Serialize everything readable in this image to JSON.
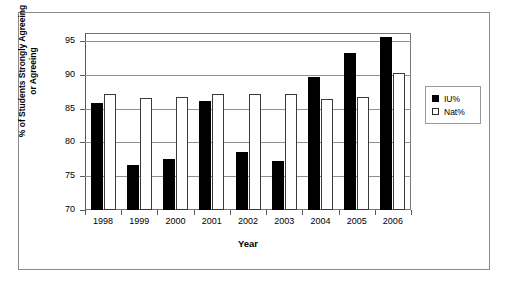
{
  "chart_data": {
    "type": "bar",
    "title": "",
    "xlabel": "Year",
    "ylabel": "% of Students Strongly Agreeing\nor Agreeing",
    "categories": [
      "1998",
      "1999",
      "2000",
      "2001",
      "2002",
      "2003",
      "2004",
      "2005",
      "2006"
    ],
    "series": [
      {
        "name": "IU%",
        "color": "#000000",
        "values": [
          85.9,
          76.6,
          77.5,
          86.1,
          78.6,
          77.2,
          89.7,
          93.3,
          95.6
        ]
      },
      {
        "name": "Nat%",
        "color": "#ffffff",
        "values": [
          87.2,
          86.6,
          86.8,
          87.2,
          87.2,
          87.2,
          86.5,
          86.8,
          90.3
        ]
      }
    ],
    "ylim": [
      70,
      96.2
    ],
    "yticks": [
      70,
      75,
      80,
      85,
      90,
      95
    ],
    "ytick_labels": [
      "70",
      "75",
      "80",
      "85",
      "90",
      "95"
    ],
    "grid": true,
    "grid_axis": "y",
    "legend_position": "right-outside"
  },
  "legend": {
    "items": [
      {
        "label": "IU%",
        "swatch": "filled-square-icon"
      },
      {
        "label": "Nat%",
        "swatch": "empty-square-icon"
      }
    ]
  },
  "axes": {
    "y_title": "% of Students Strongly Agreeing\nor Agreeing",
    "x_title": "Year"
  }
}
